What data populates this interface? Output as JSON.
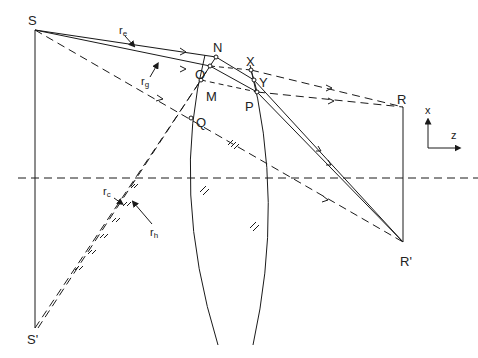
{
  "diagram": {
    "type": "optics-ray-diagram",
    "colors": {
      "line": "#1a1a1a",
      "background": "#ffffff"
    },
    "points": {
      "S": "S",
      "S_prime": "S'",
      "R": "R",
      "R_prime": "R'",
      "N": "N",
      "O": "O",
      "M": "M",
      "Q": "Q",
      "X": "X",
      "Y": "Y",
      "P": "P"
    },
    "rays": {
      "re": {
        "main": "r",
        "sub": "e"
      },
      "rg": {
        "main": "r",
        "sub": "g"
      },
      "rc": {
        "main": "r",
        "sub": "c"
      },
      "rh": {
        "main": "r",
        "sub": "h"
      }
    },
    "axes": {
      "x": "x",
      "z": "z"
    },
    "elements": [
      "lens",
      "optical-axis",
      "object-arrow S-S'",
      "image-arrow R-R'"
    ]
  }
}
